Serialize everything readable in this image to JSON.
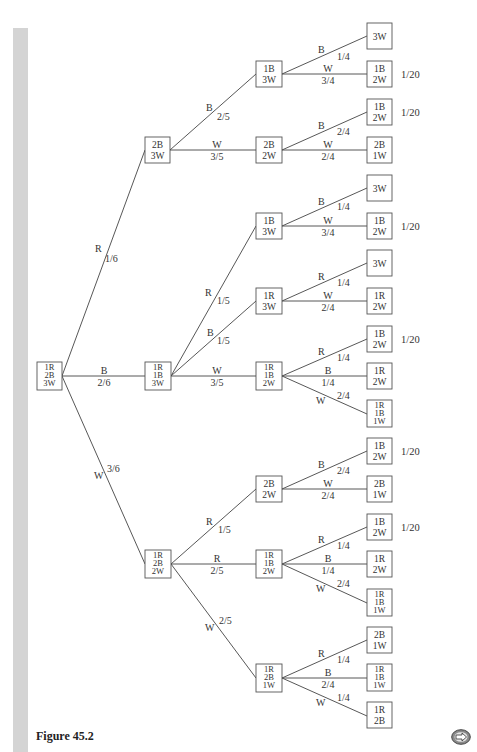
{
  "figure": {
    "caption": "Figure 45.2",
    "next_button": "next-page"
  },
  "nodes": {
    "root": [
      "1R",
      "2B",
      "3W"
    ],
    "l1_a": [
      "2B",
      "3W"
    ],
    "l1_b": [
      "1R",
      "1B",
      "3W"
    ],
    "l1_c": [
      "1R",
      "2B",
      "2W"
    ],
    "l2_1": [
      "1B",
      "3W"
    ],
    "l2_2": [
      "2B",
      "2W"
    ],
    "l2_3": [
      "1B",
      "3W"
    ],
    "l2_4": [
      "1R",
      "3W"
    ],
    "l2_5": [
      "1R",
      "1B",
      "2W"
    ],
    "l2_6": [
      "2B",
      "2W"
    ],
    "l2_7": [
      "1R",
      "1B",
      "2W"
    ],
    "l2_8": [
      "1R",
      "2B",
      "1W"
    ],
    "leaf_1": [
      "3W"
    ],
    "leaf_2": [
      "1B",
      "2W"
    ],
    "leaf_3": [
      "1B",
      "2W"
    ],
    "leaf_4": [
      "2B",
      "1W"
    ],
    "leaf_5": [
      "3W"
    ],
    "leaf_6": [
      "1B",
      "2W"
    ],
    "leaf_7": [
      "3W"
    ],
    "leaf_8": [
      "1R",
      "2W"
    ],
    "leaf_9": [
      "1B",
      "2W"
    ],
    "leaf_10": [
      "1R",
      "2W"
    ],
    "leaf_11": [
      "1R",
      "1B",
      "1W"
    ],
    "leaf_12": [
      "1B",
      "2W"
    ],
    "leaf_13": [
      "2B",
      "1W"
    ],
    "leaf_14": [
      "1B",
      "2W"
    ],
    "leaf_15": [
      "1R",
      "2W"
    ],
    "leaf_16": [
      "1R",
      "1B",
      "1W"
    ],
    "leaf_17": [
      "2B",
      "1W"
    ],
    "leaf_18": [
      "1R",
      "1B",
      "1W"
    ],
    "leaf_19": [
      "1R",
      "2B"
    ]
  },
  "edges": {
    "root_a": {
      "color": "R",
      "prob": "1/6"
    },
    "root_b": {
      "color": "B",
      "prob": "2/6"
    },
    "root_c": {
      "color": "W",
      "prob": "3/6"
    },
    "a_1": {
      "color": "B",
      "prob": "2/5"
    },
    "a_2": {
      "color": "W",
      "prob": "3/5"
    },
    "b_3": {
      "color": "R",
      "prob": "1/5"
    },
    "b_4": {
      "color": "B",
      "prob": "1/5"
    },
    "b_5": {
      "color": "W",
      "prob": "3/5"
    },
    "c_6": {
      "color": "R",
      "prob": "1/5"
    },
    "c_7": {
      "color": "R",
      "prob": "2/5"
    },
    "c_8": {
      "color": "W",
      "prob": "2/5"
    },
    "e1_1": {
      "color": "B",
      "prob": "1/4"
    },
    "e1_2": {
      "color": "W",
      "prob": "3/4"
    },
    "e2_3": {
      "color": "B",
      "prob": "2/4"
    },
    "e2_4": {
      "color": "W",
      "prob": "2/4"
    },
    "e3_5": {
      "color": "B",
      "prob": "1/4"
    },
    "e3_6": {
      "color": "W",
      "prob": "3/4"
    },
    "e4_7": {
      "color": "R",
      "prob": "1/4"
    },
    "e4_8": {
      "color": "W",
      "prob": "2/4"
    },
    "e5_9": {
      "color": "R",
      "prob": "1/4"
    },
    "e5_10": {
      "color": "B",
      "prob": "1/4"
    },
    "e5_11": {
      "color": "W",
      "prob": "2/4"
    },
    "e6_12": {
      "color": "B",
      "prob": "2/4"
    },
    "e6_13": {
      "color": "W",
      "prob": "2/4"
    },
    "e7_14": {
      "color": "R",
      "prob": "1/4"
    },
    "e7_15": {
      "color": "B",
      "prob": "1/4"
    },
    "e7_16": {
      "color": "W",
      "prob": "2/4"
    },
    "e8_17": {
      "color": "R",
      "prob": "1/4"
    },
    "e8_18": {
      "color": "B",
      "prob": "2/4"
    },
    "e8_19": {
      "color": "W",
      "prob": "1/4"
    }
  },
  "outcomes": {
    "leaf_2": "1/20",
    "leaf_3": "1/20",
    "leaf_6": "1/20",
    "leaf_9": "1/20",
    "leaf_12": "1/20",
    "leaf_14": "1/20"
  }
}
